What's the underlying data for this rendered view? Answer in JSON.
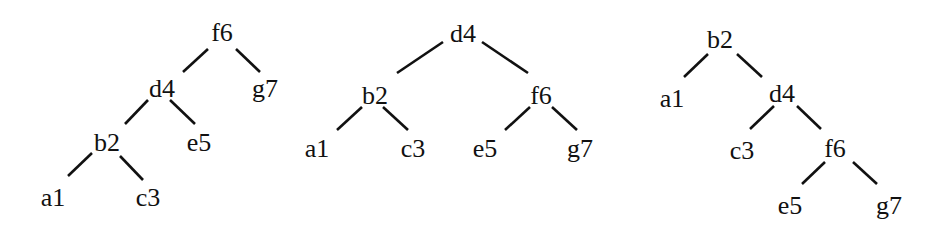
{
  "trees": [
    {
      "name": "tree-left",
      "nodes": [
        {
          "id": "f6",
          "label": "f6",
          "x": 222,
          "y": 32
        },
        {
          "id": "d4",
          "label": "d4",
          "x": 162,
          "y": 88
        },
        {
          "id": "g7",
          "label": "g7",
          "x": 265,
          "y": 88
        },
        {
          "id": "b2",
          "label": "b2",
          "x": 107,
          "y": 142
        },
        {
          "id": "e5",
          "label": "e5",
          "x": 199,
          "y": 142
        },
        {
          "id": "a1",
          "label": "a1",
          "x": 53,
          "y": 197
        },
        {
          "id": "c3",
          "label": "c3",
          "x": 148,
          "y": 197
        }
      ],
      "edges": [
        {
          "from": "f6",
          "to": "d4",
          "x1": 208,
          "y1": 49,
          "x2": 183,
          "y2": 72
        },
        {
          "from": "f6",
          "to": "g7",
          "x1": 236,
          "y1": 49,
          "x2": 260,
          "y2": 72
        },
        {
          "from": "d4",
          "to": "b2",
          "x1": 148,
          "y1": 100,
          "x2": 125,
          "y2": 124
        },
        {
          "from": "d4",
          "to": "e5",
          "x1": 170,
          "y1": 100,
          "x2": 195,
          "y2": 124
        },
        {
          "from": "b2",
          "to": "a1",
          "x1": 92,
          "y1": 153,
          "x2": 68,
          "y2": 176
        },
        {
          "from": "b2",
          "to": "c3",
          "x1": 120,
          "y1": 156,
          "x2": 143,
          "y2": 180
        }
      ]
    },
    {
      "name": "tree-middle",
      "nodes": [
        {
          "id": "d4",
          "label": "d4",
          "x": 463,
          "y": 33
        },
        {
          "id": "b2",
          "label": "b2",
          "x": 375,
          "y": 95
        },
        {
          "id": "f6",
          "label": "f6",
          "x": 541,
          "y": 95
        },
        {
          "id": "a1",
          "label": "a1",
          "x": 317,
          "y": 148
        },
        {
          "id": "c3",
          "label": "c3",
          "x": 413,
          "y": 148
        },
        {
          "id": "e5",
          "label": "e5",
          "x": 485,
          "y": 148
        },
        {
          "id": "g7",
          "label": "g7",
          "x": 580,
          "y": 148
        }
      ],
      "edges": [
        {
          "from": "d4",
          "to": "b2",
          "x1": 443,
          "y1": 42,
          "x2": 397,
          "y2": 73
        },
        {
          "from": "d4",
          "to": "f6",
          "x1": 482,
          "y1": 42,
          "x2": 528,
          "y2": 73
        },
        {
          "from": "b2",
          "to": "a1",
          "x1": 362,
          "y1": 107,
          "x2": 337,
          "y2": 130
        },
        {
          "from": "b2",
          "to": "c3",
          "x1": 383,
          "y1": 107,
          "x2": 408,
          "y2": 130
        },
        {
          "from": "f6",
          "to": "e5",
          "x1": 530,
          "y1": 107,
          "x2": 505,
          "y2": 130
        },
        {
          "from": "f6",
          "to": "g7",
          "x1": 552,
          "y1": 107,
          "x2": 577,
          "y2": 130
        }
      ]
    },
    {
      "name": "tree-right",
      "nodes": [
        {
          "id": "b2",
          "label": "b2",
          "x": 720,
          "y": 39
        },
        {
          "id": "a1",
          "label": "a1",
          "x": 672,
          "y": 98
        },
        {
          "id": "d4",
          "label": "d4",
          "x": 782,
          "y": 93
        },
        {
          "id": "c3",
          "label": "c3",
          "x": 742,
          "y": 150
        },
        {
          "id": "f6",
          "label": "f6",
          "x": 835,
          "y": 148
        },
        {
          "id": "e5",
          "label": "e5",
          "x": 790,
          "y": 205
        },
        {
          "id": "g7",
          "label": "g7",
          "x": 889,
          "y": 205
        }
      ],
      "edges": [
        {
          "from": "b2",
          "to": "a1",
          "x1": 708,
          "y1": 54,
          "x2": 684,
          "y2": 77
        },
        {
          "from": "b2",
          "to": "d4",
          "x1": 737,
          "y1": 54,
          "x2": 762,
          "y2": 77
        },
        {
          "from": "d4",
          "to": "c3",
          "x1": 774,
          "y1": 106,
          "x2": 750,
          "y2": 129
        },
        {
          "from": "d4",
          "to": "f6",
          "x1": 797,
          "y1": 106,
          "x2": 821,
          "y2": 129
        },
        {
          "from": "f6",
          "to": "e5",
          "x1": 825,
          "y1": 162,
          "x2": 802,
          "y2": 184
        },
        {
          "from": "f6",
          "to": "g7",
          "x1": 853,
          "y1": 162,
          "x2": 877,
          "y2": 184
        }
      ]
    }
  ]
}
